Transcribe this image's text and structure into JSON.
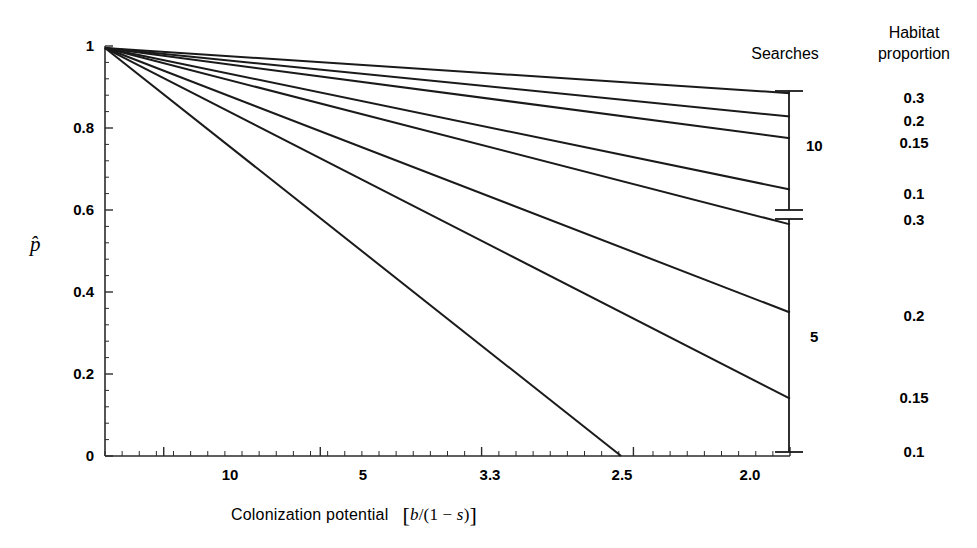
{
  "figure": {
    "background": "#ffffff",
    "line_color": "#1a1a1a",
    "axis_color": "#2b2b2b"
  },
  "axes": {
    "y_title": "p̂",
    "y_ticks": [
      "1",
      "0.8",
      "0.6",
      "0.4",
      "0.2",
      "0"
    ],
    "y_tick_values": [
      1,
      0.8,
      0.6,
      0.4,
      0.2,
      0
    ],
    "x_ticks": [
      "10",
      "5",
      "3.3",
      "2.5",
      "2.0"
    ],
    "x_tick_values": [
      10,
      5,
      3.3,
      2.5,
      2.0
    ],
    "x_title_main": "Colonization potential",
    "x_title_math_b": "b",
    "x_title_math_slash": "/(1 − ",
    "x_title_math_s": "s",
    "x_title_math_close": ")",
    "x_title_bracket_open": "[",
    "x_title_bracket_close": "]"
  },
  "legend": {
    "searches_heading": "Searches",
    "habitat_heading_line1": "Habitat",
    "habitat_heading_line2": "proportion",
    "brackets": [
      {
        "label": "10"
      },
      {
        "label": "5"
      }
    ],
    "habitat_values": [
      "0.3",
      "0.2",
      "0.15",
      "0.1",
      "0.3",
      "0.2",
      "0.15",
      "0.1"
    ]
  },
  "chart_data": {
    "type": "line",
    "title": "",
    "xlabel": "Colonization potential  [b/(1 - s)]",
    "ylabel": "p-hat",
    "xlim": [
      16.0,
      2.0
    ],
    "ylim": [
      0,
      1
    ],
    "x_axis_note": "reciprocal scale; position linear in 1/x, ticks at 10, 5, 3.3, 2.5, 2.0",
    "grid": false,
    "legend_position": "right",
    "series": [
      {
        "name": "Searches 10, habitat proportion 0.3",
        "searches": 10,
        "habitat_proportion": 0.3,
        "x": [
          16.0,
          2.0
        ],
        "y": [
          0.995,
          0.885
        ]
      },
      {
        "name": "Searches 10, habitat proportion 0.2",
        "searches": 10,
        "habitat_proportion": 0.2,
        "x": [
          16.0,
          2.0
        ],
        "y": [
          0.995,
          0.828
        ]
      },
      {
        "name": "Searches 10, habitat proportion 0.15",
        "searches": 10,
        "habitat_proportion": 0.15,
        "x": [
          16.0,
          2.0
        ],
        "y": [
          0.995,
          0.775
        ]
      },
      {
        "name": "Searches 10, habitat proportion 0.1",
        "searches": 10,
        "habitat_proportion": 0.1,
        "x": [
          16.0,
          2.0
        ],
        "y": [
          0.995,
          0.65
        ]
      },
      {
        "name": "Searches 5, habitat proportion 0.3",
        "searches": 5,
        "habitat_proportion": 0.3,
        "x": [
          16.0,
          2.0
        ],
        "y": [
          0.995,
          0.565
        ]
      },
      {
        "name": "Searches 5, habitat proportion 0.2",
        "searches": 5,
        "habitat_proportion": 0.2,
        "x": [
          16.0,
          2.0
        ],
        "y": [
          0.995,
          0.35
        ]
      },
      {
        "name": "Searches 5, habitat proportion 0.15",
        "searches": 5,
        "habitat_proportion": 0.15,
        "x": [
          16.0,
          2.0
        ],
        "y": [
          0.995,
          0.14
        ]
      },
      {
        "name": "Searches 5, habitat proportion 0.1",
        "searches": 5,
        "habitat_proportion": 0.1,
        "x": [
          16.0,
          2.55
        ],
        "y": [
          0.995,
          0.0
        ]
      }
    ]
  }
}
